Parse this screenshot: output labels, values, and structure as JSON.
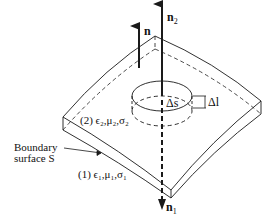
{
  "diagram": {
    "type": "boundary-surface-pillbox",
    "labels": {
      "n": "n",
      "n2": "n",
      "n2_sub": "2",
      "n1": "n",
      "n1_sub": "1",
      "delta_s": "Δs",
      "delta_l": "Δl",
      "region2": "(2) ϵ₂,μ₂,σ₂",
      "region1": "(1) ϵ₁,μ₁,σ₁",
      "boundary_line1": "Boundary",
      "boundary_line2": "surface S"
    },
    "colors": {
      "stroke": "#1a1a1a",
      "background": "#ffffff"
    }
  }
}
